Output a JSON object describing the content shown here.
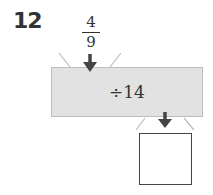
{
  "question": {
    "number": "12"
  },
  "input": {
    "numerator": "4",
    "denominator": "9"
  },
  "machine": {
    "operation": "÷14",
    "fill": "#e2e2e2"
  },
  "output": {
    "answer": ""
  },
  "colors": {
    "arrow": "#444444",
    "funnel": "#bbbbbb"
  }
}
